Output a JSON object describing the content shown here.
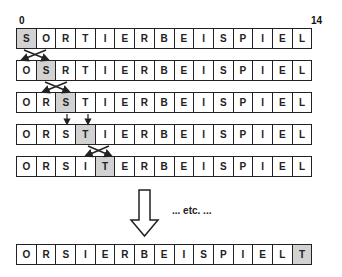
{
  "diagram": {
    "start_index_label": "0",
    "end_index_label": "14",
    "etc_label": "... etc. ...",
    "highlight_color": "#d2d2d2",
    "rows": [
      {
        "cells": [
          "S",
          "O",
          "R",
          "T",
          "I",
          "E",
          "R",
          "B",
          "E",
          "I",
          "S",
          "P",
          "I",
          "E",
          "L"
        ],
        "highlight": 0
      },
      {
        "cells": [
          "O",
          "S",
          "R",
          "T",
          "I",
          "E",
          "R",
          "B",
          "E",
          "I",
          "S",
          "P",
          "I",
          "E",
          "L"
        ],
        "highlight": 1
      },
      {
        "cells": [
          "O",
          "R",
          "S",
          "T",
          "I",
          "E",
          "R",
          "B",
          "E",
          "I",
          "S",
          "P",
          "I",
          "E",
          "L"
        ],
        "highlight": 2
      },
      {
        "cells": [
          "O",
          "R",
          "S",
          "T",
          "I",
          "E",
          "R",
          "B",
          "E",
          "I",
          "S",
          "P",
          "I",
          "E",
          "L"
        ],
        "highlight": 3
      },
      {
        "cells": [
          "O",
          "R",
          "S",
          "I",
          "T",
          "E",
          "R",
          "B",
          "E",
          "I",
          "S",
          "P",
          "I",
          "E",
          "L"
        ],
        "highlight": 4
      }
    ],
    "final_row": {
      "cells": [
        "O",
        "R",
        "S",
        "I",
        "E",
        "R",
        "B",
        "E",
        "I",
        "S",
        "P",
        "I",
        "E",
        "L",
        "T"
      ],
      "highlight": 14
    },
    "transitions": [
      {
        "between": [
          0,
          1
        ],
        "type": "swap",
        "positions": [
          0,
          1
        ]
      },
      {
        "between": [
          1,
          2
        ],
        "type": "swap",
        "positions": [
          1,
          2
        ]
      },
      {
        "between": [
          2,
          3
        ],
        "type": "no-swap",
        "positions": [
          2,
          3
        ]
      },
      {
        "between": [
          3,
          4
        ],
        "type": "swap",
        "positions": [
          3,
          4
        ]
      }
    ]
  }
}
